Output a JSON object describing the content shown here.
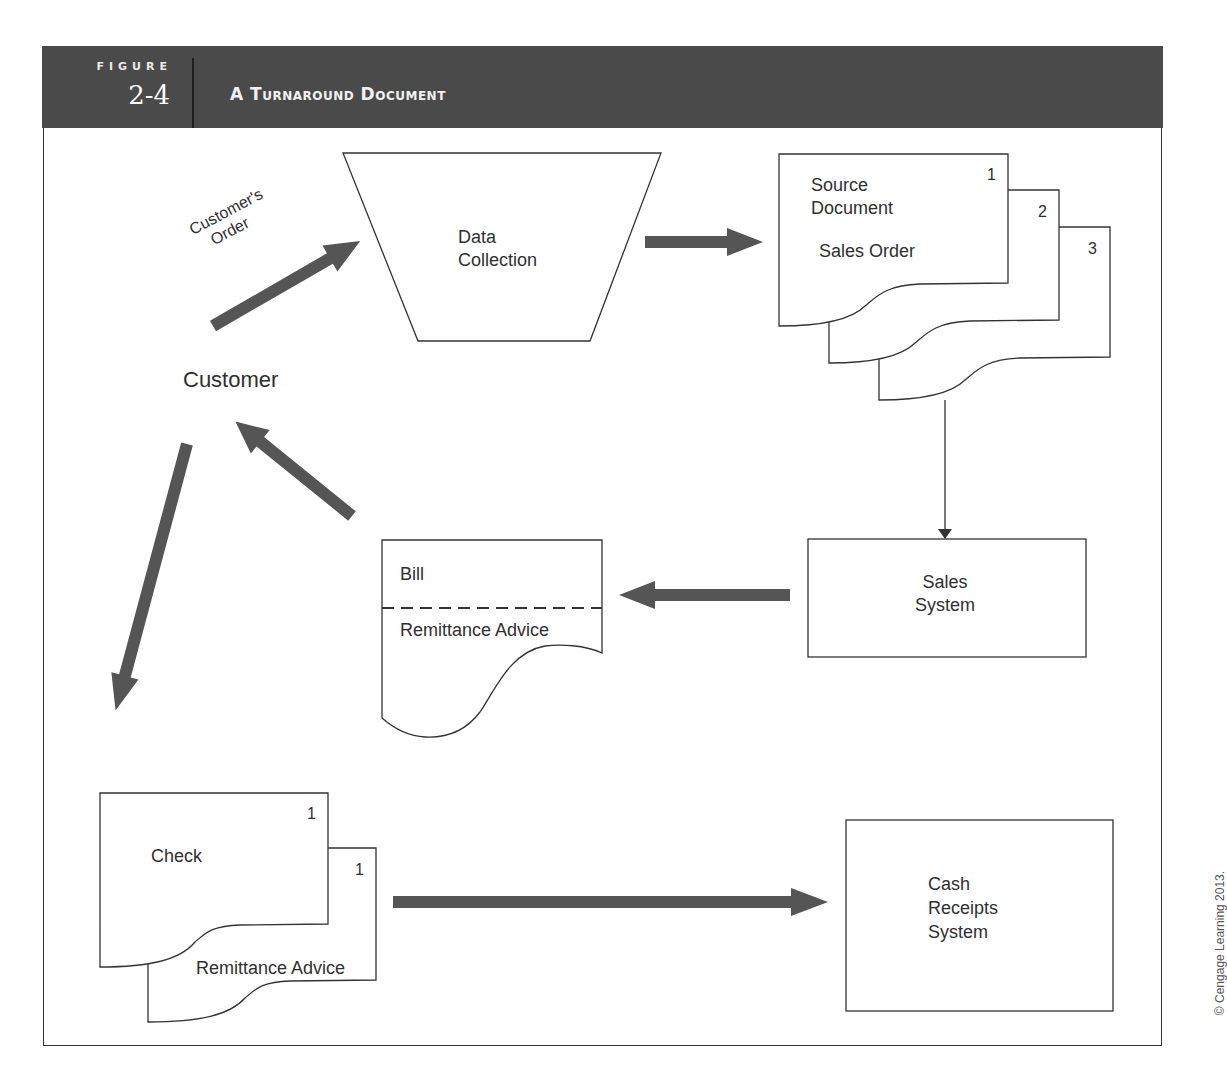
{
  "figure": {
    "label": "FIGURE",
    "number": "2-4",
    "title": "A Turnaround Document"
  },
  "diagram": {
    "entity_customer": "Customer",
    "flow_customer_order": [
      "Customer's",
      "Order"
    ],
    "data_collection": [
      "Data",
      "Collection"
    ],
    "source_document_stack": {
      "title": [
        "Source",
        "Document"
      ],
      "subtitle": "Sales Order",
      "copies": [
        "1",
        "2",
        "3"
      ]
    },
    "sales_system": [
      "Sales",
      "System"
    ],
    "bill_document": {
      "top_section": "Bill",
      "bottom_section": "Remittance Advice"
    },
    "check_stack": {
      "check_label": "Check",
      "check_copy": "1",
      "remittance_label": "Remittance Advice",
      "remittance_copy": "1"
    },
    "cash_receipts_system": [
      "Cash",
      "Receipts",
      "System"
    ]
  },
  "colors": {
    "header_bg": "#4a4a4a",
    "arrow_fill": "#555555",
    "line": "#333333"
  },
  "copyright": "© Cengage Learning 2013."
}
